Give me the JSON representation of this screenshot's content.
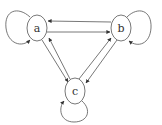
{
  "diagram": {
    "type": "directed-graph",
    "colors": {
      "stroke": "#555555",
      "text": "#333333",
      "background": "#ffffff"
    },
    "nodes": [
      {
        "id": "a",
        "label": "a"
      },
      {
        "id": "b",
        "label": "b"
      },
      {
        "id": "c",
        "label": "c"
      }
    ],
    "edges": [
      {
        "from": "a",
        "to": "a"
      },
      {
        "from": "b",
        "to": "b"
      },
      {
        "from": "c",
        "to": "c"
      },
      {
        "from": "a",
        "to": "b"
      },
      {
        "from": "b",
        "to": "a"
      },
      {
        "from": "a",
        "to": "c"
      },
      {
        "from": "c",
        "to": "a"
      },
      {
        "from": "b",
        "to": "c"
      },
      {
        "from": "c",
        "to": "b"
      }
    ]
  }
}
